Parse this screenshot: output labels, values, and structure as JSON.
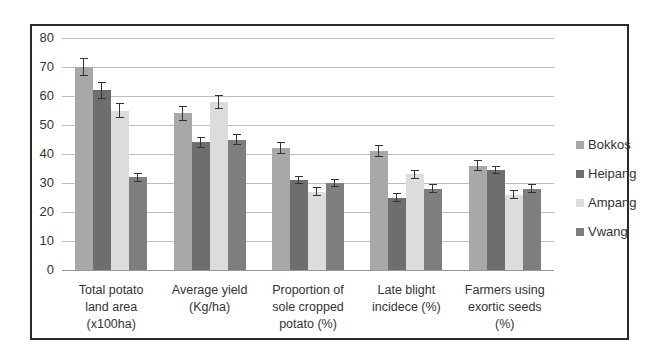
{
  "chart_data": {
    "type": "bar",
    "title": "",
    "xlabel": "",
    "ylabel": "",
    "ylim": [
      0,
      80
    ],
    "yticks": [
      0,
      10,
      20,
      30,
      40,
      50,
      60,
      70,
      80
    ],
    "grid": true,
    "legend_position": "right",
    "error_bars": true,
    "categories": [
      "Total potato land area (x100ha)",
      "Average yield (Kg/ha)",
      "Proportion of sole cropped potato (%)",
      "Late blight incidece (%)",
      "Farmers using exortic seeds (%)"
    ],
    "series": [
      {
        "name": "Bokkos",
        "color": "#a8a8a8",
        "values": [
          70,
          54,
          42,
          41,
          36
        ],
        "errors": [
          3,
          2.5,
          2,
          2,
          2
        ]
      },
      {
        "name": "Heipang",
        "color": "#6e6e6e",
        "values": [
          62,
          44,
          31,
          25,
          34.5
        ],
        "errors": [
          3,
          2,
          1.5,
          1.5,
          1.5
        ]
      },
      {
        "name": "Ampang",
        "color": "#dcdcdc",
        "values": [
          55,
          58,
          27,
          33,
          26
        ],
        "errors": [
          2.5,
          2.5,
          1.5,
          1.5,
          1.5
        ]
      },
      {
        "name": "Vwang",
        "color": "#7e7e7e",
        "values": [
          32,
          45,
          30,
          28,
          28
        ],
        "errors": [
          1.5,
          2,
          1.5,
          1.5,
          1.5
        ]
      }
    ]
  },
  "xlabels": [
    "Total potato\nland area\n(x100ha)",
    "Average yield\n(Kg/ha)",
    "Proportion of\nsole cropped\npotato (%)",
    "Late blight\nincidece (%)",
    "Farmers using\nexortic seeds\n(%)"
  ]
}
